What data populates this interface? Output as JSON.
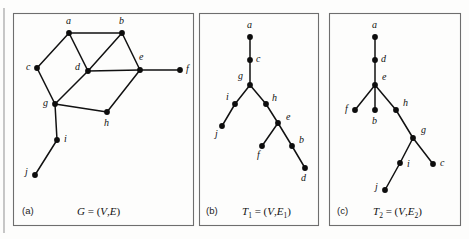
{
  "figure": {
    "background_color": "#fdfdfc",
    "border_color": "#6e6e6e",
    "node_color": "#0d0d0d",
    "edge_color": "#111111",
    "width": 469,
    "height": 239
  },
  "panels": [
    {
      "id": "a",
      "tag": "(a)",
      "caption_parts": {
        "symbol": "G",
        "equals": " = (",
        "v": "V",
        "comma": ",",
        "e": "E",
        "close": ")"
      },
      "caption_text": "G = (V,E)",
      "frame": {
        "x": 13,
        "y": 13,
        "width": 180,
        "height": 212
      },
      "caption_tag_pos": {
        "x": 22,
        "y": 214
      },
      "caption_eq_pos": {
        "x": 77,
        "y": 215
      },
      "nodes": [
        {
          "label": "a",
          "x": 69,
          "y": 33,
          "lx": 66,
          "ly": 24
        },
        {
          "label": "b",
          "x": 122,
          "y": 33,
          "lx": 119,
          "ly": 24
        },
        {
          "label": "c",
          "x": 37,
          "y": 68,
          "lx": 26,
          "ly": 70
        },
        {
          "label": "d",
          "x": 88,
          "y": 71,
          "lx": 75,
          "ly": 70
        },
        {
          "label": "e",
          "x": 140,
          "y": 70,
          "lx": 139,
          "ly": 60
        },
        {
          "label": "f",
          "x": 180,
          "y": 70,
          "lx": 186,
          "ly": 72
        },
        {
          "label": "g",
          "x": 55,
          "y": 104,
          "lx": 43,
          "ly": 106
        },
        {
          "label": "h",
          "x": 107,
          "y": 112,
          "lx": 104,
          "ly": 126
        },
        {
          "label": "i",
          "x": 57,
          "y": 140,
          "lx": 64,
          "ly": 142
        },
        {
          "label": "j",
          "x": 35,
          "y": 175,
          "lx": 25,
          "ly": 175
        }
      ],
      "edges": [
        [
          "a",
          "b"
        ],
        [
          "a",
          "c"
        ],
        [
          "a",
          "d"
        ],
        [
          "b",
          "d"
        ],
        [
          "b",
          "e"
        ],
        [
          "c",
          "g"
        ],
        [
          "d",
          "e"
        ],
        [
          "d",
          "g"
        ],
        [
          "e",
          "f"
        ],
        [
          "e",
          "h"
        ],
        [
          "g",
          "h"
        ],
        [
          "g",
          "i"
        ],
        [
          "i",
          "j"
        ]
      ]
    },
    {
      "id": "b",
      "tag": "(b)",
      "caption_parts": {
        "symbol": "T",
        "sub": "1",
        "equals": " = (",
        "v": "V",
        "comma": ",",
        "e": "E",
        "esub": "1",
        "close": ")"
      },
      "caption_text": "T1 = (V,E1)",
      "frame": {
        "x": 199,
        "y": 13,
        "width": 119,
        "height": 212
      },
      "caption_tag_pos": {
        "x": 206,
        "y": 214
      },
      "caption_eq_pos": {
        "x": 242,
        "y": 215
      },
      "nodes": [
        {
          "label": "a",
          "x": 250,
          "y": 37,
          "lx": 247,
          "ly": 28
        },
        {
          "label": "c",
          "x": 250,
          "y": 60,
          "lx": 256,
          "ly": 62
        },
        {
          "label": "g",
          "x": 250,
          "y": 85,
          "lx": 238,
          "ly": 79
        },
        {
          "label": "i",
          "x": 235,
          "y": 104,
          "lx": 226,
          "ly": 100
        },
        {
          "label": "j",
          "x": 222,
          "y": 126,
          "lx": 215,
          "ly": 137
        },
        {
          "label": "h",
          "x": 266,
          "y": 104,
          "lx": 272,
          "ly": 101
        },
        {
          "label": "e",
          "x": 278,
          "y": 123,
          "lx": 286,
          "ly": 120
        },
        {
          "label": "f",
          "x": 262,
          "y": 146,
          "lx": 257,
          "ly": 158
        },
        {
          "label": "b",
          "x": 292,
          "y": 146,
          "lx": 299,
          "ly": 143
        },
        {
          "label": "d",
          "x": 305,
          "y": 168,
          "lx": 301,
          "ly": 181
        }
      ],
      "edges": [
        [
          "a",
          "c"
        ],
        [
          "c",
          "g"
        ],
        [
          "g",
          "i"
        ],
        [
          "i",
          "j"
        ],
        [
          "g",
          "h"
        ],
        [
          "h",
          "e"
        ],
        [
          "e",
          "f"
        ],
        [
          "e",
          "b"
        ],
        [
          "b",
          "d"
        ]
      ]
    },
    {
      "id": "c",
      "tag": "(c)",
      "caption_parts": {
        "symbol": "T",
        "sub": "2",
        "equals": " = (",
        "v": "V",
        "comma": ",",
        "e": "E",
        "esub": "2",
        "close": ")"
      },
      "caption_text": "T2 = (V,E2)",
      "frame": {
        "x": 329,
        "y": 13,
        "width": 131,
        "height": 212
      },
      "caption_tag_pos": {
        "x": 337,
        "y": 214
      },
      "caption_eq_pos": {
        "x": 373,
        "y": 215
      },
      "nodes": [
        {
          "label": "a",
          "x": 375,
          "y": 37,
          "lx": 372,
          "ly": 28
        },
        {
          "label": "d",
          "x": 375,
          "y": 60,
          "lx": 381,
          "ly": 62
        },
        {
          "label": "e",
          "x": 375,
          "y": 85,
          "lx": 382,
          "ly": 80
        },
        {
          "label": "f",
          "x": 355,
          "y": 110,
          "lx": 345,
          "ly": 112
        },
        {
          "label": "b",
          "x": 375,
          "y": 110,
          "lx": 372,
          "ly": 124
        },
        {
          "label": "h",
          "x": 396,
          "y": 110,
          "lx": 403,
          "ly": 106
        },
        {
          "label": "g",
          "x": 413,
          "y": 138,
          "lx": 421,
          "ly": 133
        },
        {
          "label": "c",
          "x": 433,
          "y": 164,
          "lx": 440,
          "ly": 166
        },
        {
          "label": "i",
          "x": 400,
          "y": 163,
          "lx": 407,
          "ly": 167
        },
        {
          "label": "j",
          "x": 385,
          "y": 190,
          "lx": 375,
          "ly": 190
        }
      ],
      "edges": [
        [
          "a",
          "d"
        ],
        [
          "d",
          "e"
        ],
        [
          "e",
          "f"
        ],
        [
          "e",
          "b"
        ],
        [
          "e",
          "h"
        ],
        [
          "h",
          "g"
        ],
        [
          "g",
          "c"
        ],
        [
          "g",
          "i"
        ],
        [
          "i",
          "j"
        ]
      ]
    }
  ],
  "decorations": {
    "outer_rules": [
      {
        "x1": 4,
        "y1": 8,
        "x2": 4,
        "y2": 233
      }
    ]
  }
}
